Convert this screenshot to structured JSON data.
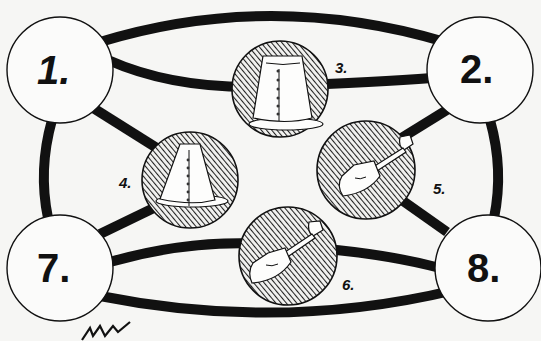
{
  "diagram": {
    "type": "network-graph",
    "background": "#f6f6f4",
    "line_color": "#111111",
    "corner_nodes": [
      {
        "id": "1",
        "label": "1.",
        "position": "top-left"
      },
      {
        "id": "2",
        "label": "2.",
        "position": "top-right"
      },
      {
        "id": "7",
        "label": "7.",
        "position": "bottom-left"
      },
      {
        "id": "8",
        "label": "8.",
        "position": "bottom-right"
      }
    ],
    "inner_nodes": [
      {
        "id": "3",
        "label": "3.",
        "icon": "bucket-icon",
        "fill": "hatched"
      },
      {
        "id": "4",
        "label": "4.",
        "icon": "bucket-icon",
        "fill": "hatched"
      },
      {
        "id": "5",
        "label": "5.",
        "icon": "spade-icon",
        "fill": "hatched"
      },
      {
        "id": "6",
        "label": "6.",
        "icon": "spade-icon",
        "fill": "hatched"
      }
    ],
    "edges": [
      {
        "from": "1",
        "to": "2",
        "style": "outer-top-arc"
      },
      {
        "from": "1",
        "to": "2",
        "style": "inner-arc-via-3"
      },
      {
        "from": "7",
        "to": "8",
        "style": "outer-bottom-arc"
      },
      {
        "from": "7",
        "to": "8",
        "style": "inner-arc-via-6"
      },
      {
        "from": "1",
        "to": "7",
        "style": "left-arc"
      },
      {
        "from": "2",
        "to": "8",
        "style": "right-arc"
      },
      {
        "from": "1",
        "to": "4",
        "style": "diagonal"
      },
      {
        "from": "4",
        "to": "7",
        "style": "diagonal"
      },
      {
        "from": "2",
        "to": "5",
        "style": "diagonal"
      },
      {
        "from": "5",
        "to": "8",
        "style": "diagonal"
      }
    ]
  }
}
